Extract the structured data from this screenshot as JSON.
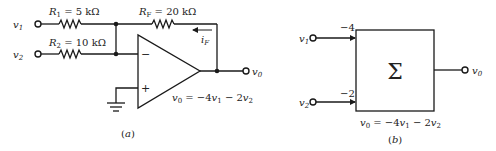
{
  "panel_a": {
    "caption": "(a)",
    "inputs": [
      {
        "name": "v",
        "sub": "1"
      },
      {
        "name": "v",
        "sub": "2"
      }
    ],
    "resistors": [
      {
        "label": "R",
        "sub": "1",
        "value": " = 5 kΩ"
      },
      {
        "label": "R",
        "sub": "2",
        "value": " = 10 kΩ"
      },
      {
        "label": "R",
        "sub": "F",
        "value": " = 20 kΩ"
      }
    ],
    "feedback_current": {
      "name": "i",
      "sub": "F"
    },
    "opamp": {
      "inverting": "−",
      "noninverting": "+"
    },
    "output": {
      "name": "v",
      "sub": "0"
    },
    "equation": {
      "lhs": "v",
      "lhs_sub": "0",
      "mid": " = −4",
      "t1": "v",
      "t1_sub": "1",
      "op": " − 2",
      "t2": "v",
      "t2_sub": "2"
    }
  },
  "panel_b": {
    "caption": "(b)",
    "block_symbol": "Σ",
    "inputs": [
      {
        "name": "v",
        "sub": "1",
        "gain": "−4"
      },
      {
        "name": "v",
        "sub": "2",
        "gain": "−2"
      }
    ],
    "output": {
      "name": "v",
      "sub": "0"
    },
    "equation": {
      "lhs": "v",
      "lhs_sub": "0",
      "mid": " = −4",
      "t1": "v",
      "t1_sub": "1",
      "op": " − 2",
      "t2": "v",
      "t2_sub": "2"
    }
  }
}
